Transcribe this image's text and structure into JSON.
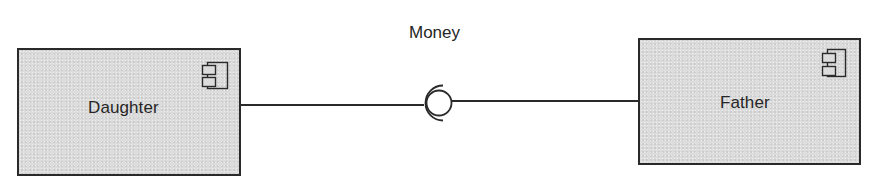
{
  "diagram": {
    "type": "UML component diagram",
    "components": [
      {
        "id": "daughter",
        "label": "Daughter",
        "role": "requires interface"
      },
      {
        "id": "father",
        "label": "Father",
        "role": "provides interface"
      }
    ],
    "interface": {
      "label": "Money",
      "provider": "Father",
      "consumer": "Daughter"
    },
    "icons": {
      "component": "uml-component-icon",
      "ball": "provided-interface-ball-icon",
      "socket": "required-interface-socket-icon"
    },
    "colors": {
      "component_fill": "#dcdcdc",
      "stroke": "#2a2a2a",
      "text": "#262626",
      "background": "#ffffff"
    }
  }
}
